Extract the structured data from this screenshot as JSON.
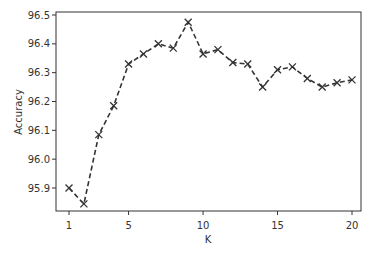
{
  "chart_data": {
    "type": "line",
    "title": "",
    "xlabel": "K",
    "ylabel": "Accuracy",
    "x": [
      1,
      2,
      3,
      4,
      5,
      6,
      7,
      8,
      9,
      10,
      11,
      12,
      13,
      14,
      15,
      16,
      17,
      18,
      19,
      20
    ],
    "series": [
      {
        "name": "Accuracy",
        "values": [
          95.9,
          95.845,
          96.085,
          96.185,
          96.33,
          96.365,
          96.4,
          96.385,
          96.475,
          96.365,
          96.38,
          96.335,
          96.33,
          96.25,
          96.31,
          96.32,
          96.28,
          96.25,
          96.265,
          96.275
        ],
        "line_style": "dashed",
        "marker": "x",
        "color": "#333333"
      }
    ],
    "xticks": [
      1,
      5,
      10,
      15,
      20
    ],
    "xtick_labels": [
      "1",
      "5",
      "10",
      "15",
      "20"
    ],
    "yticks": [
      95.9,
      96.0,
      96.1,
      96.2,
      96.3,
      96.4,
      96.5
    ],
    "ytick_labels": [
      "95.9",
      "96.0",
      "96.1",
      "96.2",
      "96.3",
      "96.4",
      "96.5"
    ],
    "xlim": [
      0.2,
      21
    ],
    "ylim": [
      95.83,
      96.5
    ],
    "grid": false,
    "legend": null
  }
}
